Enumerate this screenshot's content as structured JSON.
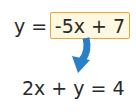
{
  "equations": {
    "top_lhs": "y =",
    "top_rhs_boxed": "-5x + 7",
    "bottom": "2x + y = 4"
  },
  "arrow": {
    "icon": "curved-arrow-down-icon",
    "color": "#2a7fc9"
  },
  "colors": {
    "box_fill": "#fff8e1",
    "box_border": "#e8a838",
    "text": "#2a2a2a"
  }
}
